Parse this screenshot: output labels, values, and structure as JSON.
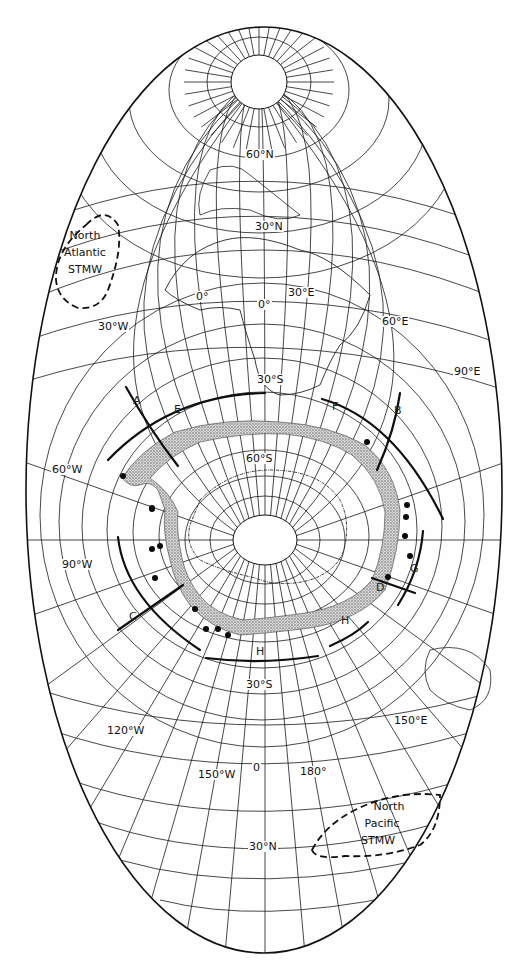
{
  "figure": {
    "type": "oblique-map-projection",
    "background": "#fefefe",
    "ink": "#111111",
    "stipple": "#9a9a9a"
  },
  "graticule_labels": [
    {
      "text": "60°N",
      "x": 257,
      "y": 155
    },
    {
      "text": "30°N",
      "x": 266,
      "y": 227
    },
    {
      "text": "0°",
      "x": 207,
      "y": 297
    },
    {
      "text": "0°",
      "x": 269,
      "y": 305
    },
    {
      "text": "30°E",
      "x": 299,
      "y": 293
    },
    {
      "text": "30°W",
      "x": 109,
      "y": 327
    },
    {
      "text": "60°E",
      "x": 393,
      "y": 322
    },
    {
      "text": "90°E",
      "x": 465,
      "y": 372
    },
    {
      "text": "30°S",
      "x": 268,
      "y": 380
    },
    {
      "text": "60°S",
      "x": 257,
      "y": 459
    },
    {
      "text": "60°W",
      "x": 63,
      "y": 470
    },
    {
      "text": "90°W",
      "x": 73,
      "y": 565
    },
    {
      "text": "30°S",
      "x": 257,
      "y": 685
    },
    {
      "text": "120°W",
      "x": 118,
      "y": 731
    },
    {
      "text": "150°E",
      "x": 405,
      "y": 721
    },
    {
      "text": "150°W",
      "x": 209,
      "y": 775
    },
    {
      "text": "0",
      "x": 264,
      "y": 768
    },
    {
      "text": "180°",
      "x": 311,
      "y": 772
    },
    {
      "text": "30°N",
      "x": 260,
      "y": 847
    }
  ],
  "section_labels": [
    {
      "text": "A",
      "x": 137,
      "y": 401
    },
    {
      "text": "E",
      "x": 178,
      "y": 410
    },
    {
      "text": "F",
      "x": 336,
      "y": 407
    },
    {
      "text": "B",
      "x": 398,
      "y": 411
    },
    {
      "text": "G",
      "x": 414,
      "y": 569
    },
    {
      "text": "D",
      "x": 380,
      "y": 588
    },
    {
      "text": "C",
      "x": 133,
      "y": 617
    },
    {
      "text": "H",
      "x": 345,
      "y": 621
    },
    {
      "text": "H",
      "x": 260,
      "y": 652
    }
  ],
  "water_masses": [
    {
      "name": "North Atlantic STMW",
      "lines": [
        "North",
        "Atlantic",
        "STMW"
      ]
    },
    {
      "name": "North Pacific STMW",
      "lines": [
        "North",
        "Pacific",
        "STMW"
      ]
    }
  ],
  "stations": [
    [
      367,
      442
    ],
    [
      407,
      505
    ],
    [
      406,
      517
    ],
    [
      405,
      536
    ],
    [
      410,
      556
    ],
    [
      388,
      577
    ],
    [
      152,
      509
    ],
    [
      160,
      546
    ],
    [
      152,
      549
    ],
    [
      155,
      578
    ],
    [
      195,
      609
    ],
    [
      206,
      629
    ],
    [
      218,
      629
    ],
    [
      228,
      635
    ],
    [
      123,
      476
    ],
    [
      152,
      508
    ]
  ]
}
